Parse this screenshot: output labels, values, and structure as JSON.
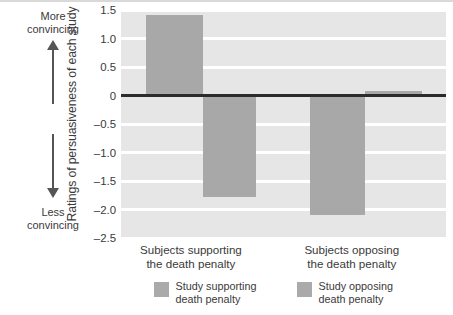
{
  "chart_data": {
    "type": "bar",
    "title": "",
    "xlabel": "",
    "ylabel": "Ratings of persuasiveness of each study",
    "ylim": [
      -2.5,
      1.5
    ],
    "grid": true,
    "legend_position": "bottom",
    "categories": [
      "Subjects supporting the death penalty",
      "Subjects opposing the death penalty"
    ],
    "series": [
      {
        "name": "Study supporting death penalty",
        "values": [
          1.42,
          -2.1
        ],
        "color": "#a8a8a8"
      },
      {
        "name": "Study opposing death penalty",
        "values": [
          -1.78,
          0.08
        ],
        "color": "#a8a8a8"
      }
    ],
    "yticks": [
      {
        "value": 1.5,
        "label": "1.5"
      },
      {
        "value": 1.0,
        "label": "1.0"
      },
      {
        "value": 0.5,
        "label": "0.5"
      },
      {
        "value": 0,
        "label": "0"
      },
      {
        "value": -0.5,
        "label": "–0.5"
      },
      {
        "value": -1.0,
        "label": "–1.0"
      },
      {
        "value": -1.5,
        "label": "–1.5"
      },
      {
        "value": -2.0,
        "label": "–2.0"
      },
      {
        "value": -2.5,
        "label": "–2.5"
      }
    ],
    "annotations": {
      "axis_anchor_high_line1": "More",
      "axis_anchor_high_line2": "convincing",
      "axis_anchor_low_line1": "Less",
      "axis_anchor_low_line2": "convincing"
    },
    "bar_geometry": [
      {
        "series": 0,
        "category": 0,
        "left_pct": 7.7,
        "width_pct": 17.5,
        "value": 1.42
      },
      {
        "series": 1,
        "category": 0,
        "left_pct": 25.2,
        "width_pct": 16.3,
        "value": -1.78
      },
      {
        "series": 0,
        "category": 1,
        "left_pct": 58.2,
        "width_pct": 16.9,
        "value": -2.1
      },
      {
        "series": 1,
        "category": 1,
        "left_pct": 75.1,
        "width_pct": 17.5,
        "value": 0.08
      }
    ]
  },
  "xaxis": {
    "groups": [
      {
        "line1": "Subjects supporting",
        "line2": "the death penalty",
        "center_pct": 21.5
      },
      {
        "line1": "Subjects opposing",
        "line2": "the death penalty",
        "center_pct": 71.0
      }
    ]
  },
  "legend": {
    "items": [
      {
        "line1": "Study supporting",
        "line2": "death penalty",
        "left_pct": 10.0,
        "color": "#aaaaaa"
      },
      {
        "line1": "Study opposing",
        "line2": "death penalty",
        "left_pct": 54.0,
        "color": "#aaaaaa"
      }
    ]
  },
  "colors": {
    "plot_background": "#e6e6e6",
    "gridline": "#ffffff",
    "zeroline": "#2b2b2b",
    "bar": "#a8a8a8",
    "text": "#3a3a3a",
    "arrow": "#555555",
    "top_rule": "#d9d9d9"
  }
}
